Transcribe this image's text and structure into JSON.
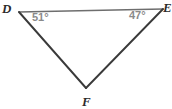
{
  "figure": {
    "kind": "geometry-diagram",
    "shape": "triangle",
    "background_color": "#ffffff",
    "width": 172,
    "height": 109,
    "stroke_color_sides": "#3a3a3a",
    "stroke_color_top": "#6e6e6e",
    "vertex_label_color": "#2b2b2b",
    "angle_label_color": "#8a8a8a",
    "vertices": [
      {
        "name": "D",
        "label": "D",
        "x": 19,
        "y": 12
      },
      {
        "name": "E",
        "label": "E",
        "x": 163,
        "y": 9
      },
      {
        "name": "F",
        "label": "F",
        "x": 86,
        "y": 88
      }
    ],
    "sides": [
      {
        "name": "side-DE",
        "from": "D",
        "to": "E"
      },
      {
        "name": "side-DF",
        "from": "D",
        "to": "F"
      },
      {
        "name": "side-EF",
        "from": "E",
        "to": "F"
      }
    ],
    "angles": [
      {
        "name": "angle-D",
        "at_vertex": "D",
        "label": "51°",
        "value": 51,
        "unit": "degrees"
      },
      {
        "name": "angle-E",
        "at_vertex": "E",
        "label": "47°",
        "value": 47,
        "unit": "degrees"
      }
    ]
  }
}
